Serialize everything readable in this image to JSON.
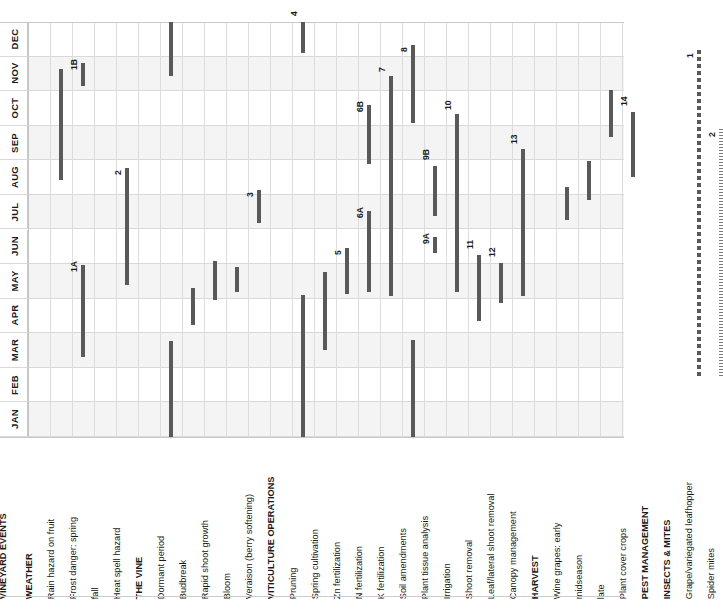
{
  "title": "VINEYARD EVENTS",
  "colors": {
    "bar": "#595959",
    "dashed_bar": "#595959",
    "dotted_bar": "#7a7a7a",
    "grid_line": "#dcdcdc",
    "band_alt": "#f4f4f4",
    "text": "#1a1a1a"
  },
  "months": [
    "DEC",
    "NOV",
    "OCT",
    "SEP",
    "AUG",
    "JUL",
    "JUN",
    "MAY",
    "APR",
    "MAR",
    "FEB",
    "JAN"
  ],
  "month_order_note": "DEC at top, JAN at bottom (chart is rotated 90 degrees)",
  "rows": [
    {
      "label": "VINEYARD EVENTS",
      "bold": true,
      "section": true
    },
    {
      "label": "WEATHER",
      "bold": true,
      "section": true
    },
    {
      "label": "Rain hazard on fruit",
      "bold": false
    },
    {
      "label": "Frost danger:   spring",
      "bold": false
    },
    {
      "label": "fall",
      "bold": false
    },
    {
      "label": "Heat spell hazard",
      "bold": false
    },
    {
      "label": "THE VINE",
      "bold": true,
      "section": true
    },
    {
      "label": "Dormant period",
      "bold": false
    },
    {
      "label": "Budbreak",
      "bold": false
    },
    {
      "label": "Rapid shoot growth",
      "bold": false
    },
    {
      "label": "Bloom",
      "bold": false
    },
    {
      "label": "Veraison (berry softening)",
      "bold": false
    },
    {
      "label": "VITICULTURE OPERATIONS",
      "bold": true,
      "section": true
    },
    {
      "label": "Pruning",
      "bold": false
    },
    {
      "label": "Spring cultivation",
      "bold": false
    },
    {
      "label": "Zn fertilization",
      "bold": false
    },
    {
      "label": "N fertilization",
      "bold": false
    },
    {
      "label": "K fertilization",
      "bold": false
    },
    {
      "label": "Soil amendments",
      "bold": false
    },
    {
      "label": "Plant tissue analysis",
      "bold": false
    },
    {
      "label": "Irrigation",
      "bold": false
    },
    {
      "label": "Shoot removal",
      "bold": false
    },
    {
      "label": "Leaf/lateral shoot removal",
      "bold": false
    },
    {
      "label": "Canopy management",
      "bold": false
    },
    {
      "label": "HARVEST",
      "bold": true,
      "section": true
    },
    {
      "label": "Wine grapes:    early",
      "bold": false
    },
    {
      "label": "midseason",
      "bold": false
    },
    {
      "label": "late",
      "bold": false
    },
    {
      "label": "Plant cover crops",
      "bold": false
    },
    {
      "label": "PEST MANAGEMENT",
      "bold": true,
      "section": true
    },
    {
      "label": "INSECTS & MITES",
      "bold": true,
      "section": true
    },
    {
      "label": "Grape/variegated leafhopper",
      "bold": false
    },
    {
      "label": "Spider mites",
      "bold": false
    }
  ],
  "chart_data": {
    "type": "bar",
    "title": "VINEYARD EVENTS",
    "orientation": "vertical-months-rotated-gantt",
    "xlabel": "",
    "ylabel": "Month",
    "categories": [
      "DEC",
      "NOV",
      "OCT",
      "SEP",
      "AUG",
      "JUL",
      "JUN",
      "MAY",
      "APR",
      "MAR",
      "FEB",
      "JAN"
    ],
    "grid": true,
    "legend": "none",
    "bars": [
      {
        "row": "Rain hazard on fruit",
        "start_month": "AUG",
        "end_month": "OCT",
        "note": "",
        "style": "solid"
      },
      {
        "row": "Frost danger:   spring",
        "start_month": "MAR",
        "end_month": "MAY",
        "note": "1A",
        "style": "solid"
      },
      {
        "row": "Frost danger:   fall",
        "start_month": "NOV",
        "end_month": "NOV",
        "note": "1B",
        "style": "solid"
      },
      {
        "row": "Heat spell hazard",
        "start_month": "JUN",
        "end_month": "AUG",
        "note": "2",
        "style": "solid"
      },
      {
        "row": "Dormant period",
        "start_month": "NOV",
        "end_month": "DEC",
        "note": "",
        "style": "solid"
      },
      {
        "row": "Dormant period (wrap)",
        "start_month": "JAN",
        "end_month": "MAR",
        "note": "",
        "style": "solid"
      },
      {
        "row": "Budbreak",
        "start_month": "APR",
        "end_month": "MAY",
        "note": "",
        "style": "solid"
      },
      {
        "row": "Rapid shoot growth",
        "start_month": "MAY",
        "end_month": "JUN",
        "note": "",
        "style": "solid"
      },
      {
        "row": "Bloom",
        "start_month": "MAY",
        "end_month": "MAY",
        "note": "",
        "style": "solid"
      },
      {
        "row": "Veraison (berry softening)",
        "start_month": "JUL",
        "end_month": "AUG",
        "note": "3",
        "style": "solid"
      },
      {
        "row": "Pruning",
        "start_month": "DEC",
        "end_month": "DEC",
        "note": "4",
        "style": "solid"
      },
      {
        "row": "Pruning (wrap)",
        "start_month": "JAN",
        "end_month": "MAR",
        "note": "",
        "style": "solid"
      },
      {
        "row": "Spring cultivation",
        "start_month": "APR",
        "end_month": "MAY",
        "note": "",
        "style": "solid"
      },
      {
        "row": "Zn fertilization",
        "start_month": "MAY",
        "end_month": "JUN",
        "note": "5",
        "style": "solid"
      },
      {
        "row": "N fertilization (6A)",
        "start_month": "MAY",
        "end_month": "JUL",
        "note": "6A",
        "style": "solid"
      },
      {
        "row": "N fertilization (6B)",
        "start_month": "SEP",
        "end_month": "OCT",
        "note": "6B",
        "style": "solid"
      },
      {
        "row": "K fertilization",
        "start_month": "MAY",
        "end_month": "NOV",
        "note": "7",
        "style": "solid"
      },
      {
        "row": "Soil amendments",
        "start_month": "OCT",
        "end_month": "DEC",
        "note": "8",
        "style": "solid"
      },
      {
        "row": "Soil amendments (wrap)",
        "start_month": "JAN",
        "end_month": "MAR",
        "note": "",
        "style": "solid"
      },
      {
        "row": "Plant tissue analysis (9A)",
        "start_month": "JUN",
        "end_month": "JUN",
        "note": "9A",
        "style": "solid"
      },
      {
        "row": "Plant tissue analysis (9B)",
        "start_month": "AUG",
        "end_month": "SEP",
        "note": "9B",
        "style": "solid"
      },
      {
        "row": "Irrigation",
        "start_month": "MAY",
        "end_month": "OCT",
        "note": "10",
        "style": "solid"
      },
      {
        "row": "Shoot removal",
        "start_month": "APR",
        "end_month": "MAY",
        "note": "11",
        "style": "solid"
      },
      {
        "row": "Leaf/lateral shoot removal",
        "start_month": "MAY",
        "end_month": "JUN",
        "note": "12",
        "style": "solid"
      },
      {
        "row": "Canopy management",
        "start_month": "MAY",
        "end_month": "SEP",
        "note": "13",
        "style": "solid"
      },
      {
        "row": "Wine grapes: early",
        "start_month": "JUL",
        "end_month": "AUG",
        "note": "",
        "style": "solid"
      },
      {
        "row": "Wine grapes: midseason",
        "start_month": "AUG",
        "end_month": "SEP",
        "note": "",
        "style": "solid"
      },
      {
        "row": "Wine grapes: late",
        "start_month": "SEP",
        "end_month": "OCT",
        "note": "",
        "style": "solid"
      },
      {
        "row": "Plant cover crops",
        "start_month": "AUG",
        "end_month": "OCT",
        "note": "14",
        "style": "solid"
      },
      {
        "row": "Grape/variegated leafhopper",
        "start_month": "FEB",
        "end_month": "NOV",
        "note": "1",
        "style": "dashed-thick"
      },
      {
        "row": "Spider mites",
        "start_month": "FEB",
        "end_month": "SEP",
        "note": "2",
        "style": "dashed-thin"
      }
    ]
  },
  "geometry": {
    "grid_top_px": 22,
    "grid_bottom_px": 437,
    "label_left_px": 0,
    "first_column_px": 28,
    "column_width_px": 22
  },
  "bar_positions": [
    {
      "name": "rain-hazard-on-fruit",
      "col": 2,
      "y1": 69,
      "y2": 180,
      "note": "",
      "style": "solid",
      "note_y": 0
    },
    {
      "name": "frost-danger-spring",
      "col": 3,
      "y1": 265,
      "y2": 357,
      "note": "1A",
      "style": "solid",
      "note_y": 262
    },
    {
      "name": "frost-danger-fall",
      "col": 3,
      "y1": 63,
      "y2": 86,
      "note": "1B",
      "style": "solid",
      "note_y": 60
    },
    {
      "name": "heat-spell-hazard",
      "col": 5,
      "y1": 168,
      "y2": 285,
      "note": "2",
      "style": "solid",
      "note_y": 165
    },
    {
      "name": "dormant-period",
      "col": 7,
      "y1": 22,
      "y2": 76,
      "note": "",
      "style": "solid",
      "note_y": 0
    },
    {
      "name": "dormant-period-wrap",
      "col": 7,
      "y1": 341,
      "y2": 437,
      "note": "",
      "style": "solid",
      "note_y": 0
    },
    {
      "name": "budbreak",
      "col": 8,
      "y1": 288,
      "y2": 325,
      "note": "",
      "style": "solid",
      "note_y": 0
    },
    {
      "name": "rapid-shoot-growth",
      "col": 9,
      "y1": 261,
      "y2": 300,
      "note": "",
      "style": "solid",
      "note_y": 0
    },
    {
      "name": "bloom",
      "col": 10,
      "y1": 267,
      "y2": 292,
      "note": "",
      "style": "solid",
      "note_y": 0
    },
    {
      "name": "veraison",
      "col": 11,
      "y1": 190,
      "y2": 223,
      "note": "3",
      "style": "solid",
      "note_y": 187
    },
    {
      "name": "pruning",
      "col": 13,
      "y1": 22,
      "y2": 53,
      "note": "4",
      "style": "solid",
      "note_y": 6
    },
    {
      "name": "pruning-wrap",
      "col": 13,
      "y1": 295,
      "y2": 437,
      "note": "",
      "style": "solid",
      "note_y": 0
    },
    {
      "name": "spring-cultivation",
      "col": 14,
      "y1": 272,
      "y2": 350,
      "note": "",
      "style": "solid",
      "note_y": 0
    },
    {
      "name": "zn-fertilization",
      "col": 15,
      "y1": 248,
      "y2": 294,
      "note": "5",
      "style": "solid",
      "note_y": 245
    },
    {
      "name": "n-fertilization-6a",
      "col": 16,
      "y1": 211,
      "y2": 292,
      "note": "6A",
      "style": "solid",
      "note_y": 208
    },
    {
      "name": "n-fertilization-6b",
      "col": 16,
      "y1": 105,
      "y2": 164,
      "note": "6B",
      "style": "solid",
      "note_y": 102
    },
    {
      "name": "k-fertilization",
      "col": 17,
      "y1": 76,
      "y2": 296,
      "note": "7",
      "style": "solid",
      "note_y": 62
    },
    {
      "name": "soil-amendments",
      "col": 18,
      "y1": 45,
      "y2": 123,
      "note": "8",
      "style": "solid",
      "note_y": 42
    },
    {
      "name": "soil-amendments-wrap",
      "col": 18,
      "y1": 340,
      "y2": 437,
      "note": "",
      "style": "solid",
      "note_y": 0
    },
    {
      "name": "plant-tissue-analysis-9a",
      "col": 19,
      "y1": 237,
      "y2": 253,
      "note": "9A",
      "style": "solid",
      "note_y": 234
    },
    {
      "name": "plant-tissue-analysis-9b",
      "col": 19,
      "y1": 166,
      "y2": 216,
      "note": "9B",
      "style": "solid",
      "note_y": 150
    },
    {
      "name": "irrigation",
      "col": 20,
      "y1": 114,
      "y2": 292,
      "note": "10",
      "style": "solid",
      "note_y": 100
    },
    {
      "name": "shoot-removal",
      "col": 21,
      "y1": 255,
      "y2": 321,
      "note": "11",
      "style": "solid",
      "note_y": 239
    },
    {
      "name": "leaf-lateral-shoot-removal",
      "col": 22,
      "y1": 263,
      "y2": 303,
      "note": "12",
      "style": "solid",
      "note_y": 247
    },
    {
      "name": "canopy-management",
      "col": 23,
      "y1": 149,
      "y2": 296,
      "note": "13",
      "style": "solid",
      "note_y": 134
    },
    {
      "name": "wine-grapes-early",
      "col": 25,
      "y1": 187,
      "y2": 220,
      "note": "",
      "style": "solid",
      "note_y": 0
    },
    {
      "name": "wine-grapes-midseason",
      "col": 26,
      "y1": 161,
      "y2": 200,
      "note": "",
      "style": "solid",
      "note_y": 0
    },
    {
      "name": "wine-grapes-late",
      "col": 27,
      "y1": 90,
      "y2": 137,
      "note": "",
      "style": "solid",
      "note_y": 0
    },
    {
      "name": "plant-cover-crops",
      "col": 28,
      "y1": 112,
      "y2": 177,
      "note": "14",
      "style": "solid",
      "note_y": 96
    },
    {
      "name": "grape-variegated-leafhopper",
      "col": 31,
      "y1": 50,
      "y2": 378,
      "note": "1",
      "style": "dashed-thick",
      "note_y": 48
    },
    {
      "name": "spider-mites",
      "col": 32,
      "y1": 129,
      "y2": 378,
      "note": "2",
      "style": "dashed-thin",
      "note_y": 127
    }
  ]
}
